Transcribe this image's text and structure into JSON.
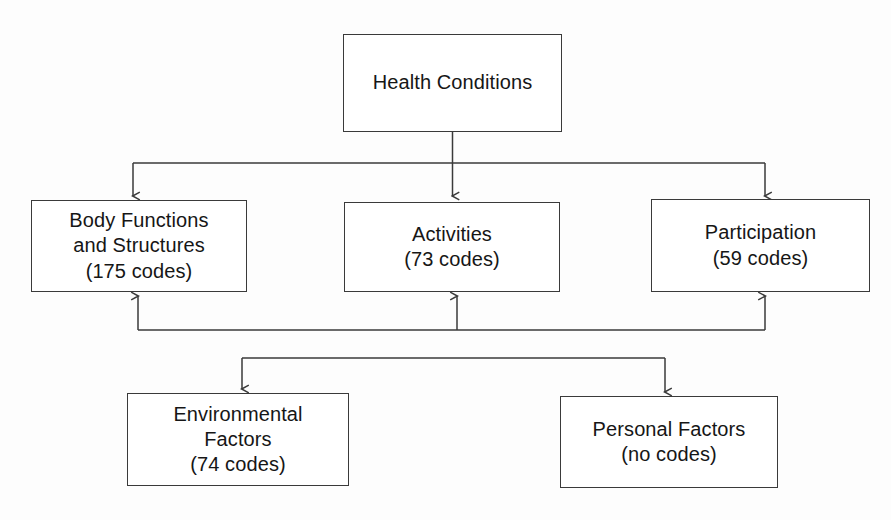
{
  "diagram": {
    "title": "Health Conditions",
    "stroke_color": "#3a3a3a",
    "text_color": "#161616",
    "background_color": "#fdfdfd",
    "nodes": [
      {
        "id": "health-conditions",
        "lines": [
          "Health Conditions"
        ],
        "row": 1
      },
      {
        "id": "body-functions",
        "lines": [
          "Body Functions",
          "and Structures",
          "(175 codes)"
        ],
        "row": 2,
        "codes": 175
      },
      {
        "id": "activities",
        "lines": [
          "Activities",
          "(73 codes)"
        ],
        "row": 2,
        "codes": 73
      },
      {
        "id": "participation",
        "lines": [
          "Participation",
          "(59 codes)"
        ],
        "row": 2,
        "codes": 59
      },
      {
        "id": "environmental-factors",
        "lines": [
          "Environmental",
          "Factors",
          "(74 codes)"
        ],
        "row": 3,
        "codes": 74
      },
      {
        "id": "personal-factors",
        "lines": [
          "Personal Factors",
          "(no codes)"
        ],
        "row": 3,
        "codes": 0
      }
    ]
  }
}
